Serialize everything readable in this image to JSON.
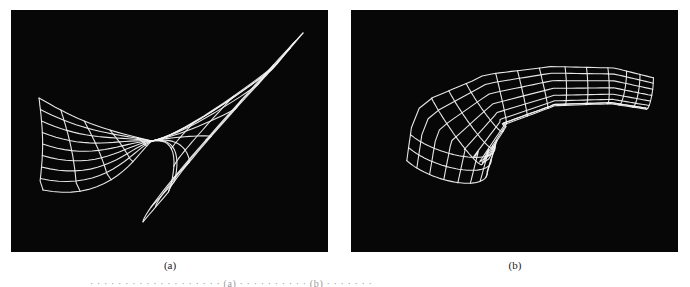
{
  "figure": {
    "panels": [
      {
        "id": "a",
        "label": "(a)",
        "description": "white wireframe saddle-shaped surface on black background",
        "background": "#070707",
        "line_color": "#f2f2f2",
        "grid": {
          "u_lines": 11,
          "v_lines": 9
        }
      },
      {
        "id": "b",
        "label": "(b)",
        "description": "white wireframe curved tubular band surface on black background",
        "background": "#070707",
        "line_color": "#f2f2f2",
        "grid": {
          "u_lines": 15,
          "v_lines": 9
        }
      }
    ],
    "caption_partial": "· · · · · · · · · · · · · · · · · · · (a) · · · · · · · · · · (b) · · · · · · ·"
  }
}
